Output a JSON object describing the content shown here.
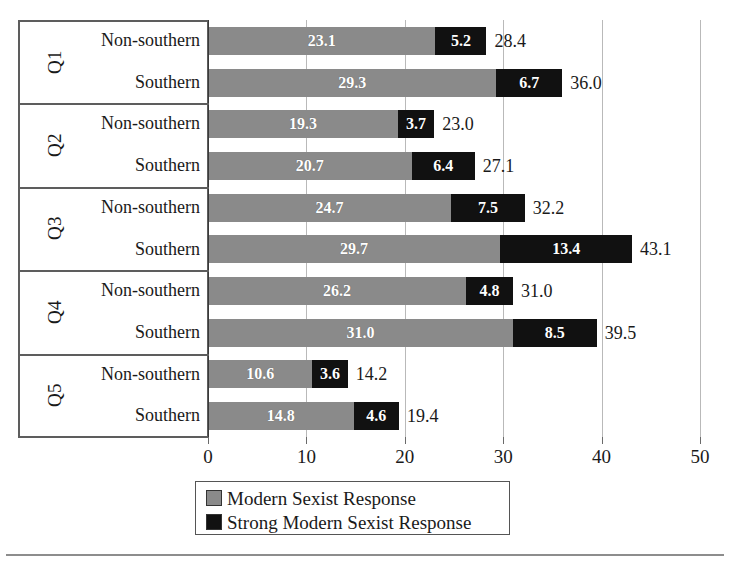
{
  "chart_data": {
    "type": "bar",
    "orientation": "horizontal",
    "stacked": true,
    "title": "",
    "xlabel": "",
    "ylabel": "",
    "xlim": [
      0,
      50
    ],
    "xticks": [
      "0",
      "10",
      "20",
      "30",
      "40",
      "50"
    ],
    "grid": "vertical",
    "legend_position": "bottom",
    "series": [
      {
        "name": "Modern Sexist Response",
        "color": "#8a8a8a",
        "values": [
          23.1,
          29.3,
          19.3,
          20.7,
          24.7,
          29.7,
          26.2,
          31.0,
          10.6,
          14.8
        ]
      },
      {
        "name": "Strong Modern Sexist Response",
        "color": "#111111",
        "values": [
          5.2,
          6.7,
          3.7,
          6.4,
          7.5,
          13.4,
          4.8,
          8.5,
          3.6,
          4.6
        ]
      }
    ],
    "categories": [
      "Q1 Non-southern",
      "Q1 Southern",
      "Q2 Non-southern",
      "Q2 Southern",
      "Q3 Non-southern",
      "Q3 Southern",
      "Q4 Non-southern",
      "Q4 Southern",
      "Q5 Non-southern",
      "Q5 Southern"
    ],
    "totals": [
      28.4,
      36.0,
      23.0,
      27.1,
      32.2,
      43.1,
      31.0,
      39.5,
      14.2,
      19.4
    ]
  },
  "groups": [
    {
      "question": "Q1",
      "rows": [
        {
          "label": "Non-southern",
          "gray": "23.1",
          "black": "5.2",
          "total": "28.4",
          "gray_value": 23.1,
          "black_value": 5.2
        },
        {
          "label": "Southern",
          "gray": "29.3",
          "black": "6.7",
          "total": "36.0",
          "gray_value": 29.3,
          "black_value": 6.7
        }
      ]
    },
    {
      "question": "Q2",
      "rows": [
        {
          "label": "Non-southern",
          "gray": "19.3",
          "black": "3.7",
          "total": "23.0",
          "gray_value": 19.3,
          "black_value": 3.7
        },
        {
          "label": "Southern",
          "gray": "20.7",
          "black": "6.4",
          "total": "27.1",
          "gray_value": 20.7,
          "black_value": 6.4
        }
      ]
    },
    {
      "question": "Q3",
      "rows": [
        {
          "label": "Non-southern",
          "gray": "24.7",
          "black": "7.5",
          "total": "32.2",
          "gray_value": 24.7,
          "black_value": 7.5
        },
        {
          "label": "Southern",
          "gray": "29.7",
          "black": "13.4",
          "total": "43.1",
          "gray_value": 29.7,
          "black_value": 13.4
        }
      ]
    },
    {
      "question": "Q4",
      "rows": [
        {
          "label": "Non-southern",
          "gray": "26.2",
          "black": "4.8",
          "total": "31.0",
          "gray_value": 26.2,
          "black_value": 4.8
        },
        {
          "label": "Southern",
          "gray": "31.0",
          "black": "8.5",
          "total": "39.5",
          "gray_value": 31.0,
          "black_value": 8.5
        }
      ]
    },
    {
      "question": "Q5",
      "rows": [
        {
          "label": "Non-southern",
          "gray": "10.6",
          "black": "3.6",
          "total": "14.2",
          "gray_value": 10.6,
          "black_value": 3.6
        },
        {
          "label": "Southern",
          "gray": "14.8",
          "black": "4.6",
          "total": "19.4",
          "gray_value": 14.8,
          "black_value": 4.6
        }
      ]
    }
  ],
  "axis": {
    "ticks": [
      "0",
      "10",
      "20",
      "30",
      "40",
      "50"
    ],
    "tick_values": [
      0,
      10,
      20,
      30,
      40,
      50
    ]
  },
  "legend": {
    "items": [
      {
        "label": "Modern Sexist Response",
        "color": "#8a8a8a"
      },
      {
        "label": "Strong Modern Sexist Response",
        "color": "#111111"
      }
    ]
  }
}
